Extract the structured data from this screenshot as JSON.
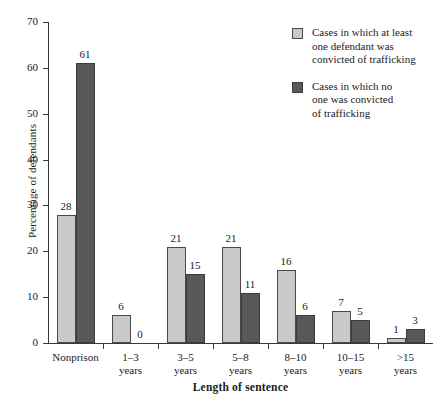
{
  "chart_data": {
    "type": "bar",
    "title": "",
    "xlabel": "Length of sentence",
    "ylabel": "Percentage of defendants",
    "ylim": [
      0,
      70
    ],
    "yticks": [
      0,
      10,
      20,
      30,
      40,
      50,
      60,
      70
    ],
    "grid": false,
    "legend_position": "top-right",
    "categories": [
      "Nonprison",
      "1–3\nyears",
      "3–5\nyears",
      "5–8\nyears",
      "8–10\nyears",
      "10–15\nyears",
      ">15\nyears"
    ],
    "series": [
      {
        "name": "Cases in which at least one defendant was convicted of trafficking",
        "color": "#c9c9c9",
        "values": [
          28,
          6,
          21,
          21,
          16,
          7,
          1
        ]
      },
      {
        "name": "Cases in which no one was convicted of trafficking",
        "color": "#585858",
        "values": [
          61,
          0,
          15,
          11,
          6,
          5,
          3
        ]
      }
    ]
  },
  "legend": {
    "entries": [
      {
        "label": "Cases in which at least\none defendant was\nconvicted of trafficking",
        "swatch": "light"
      },
      {
        "label": "Cases in which no\none was convicted\nof trafficking",
        "swatch": "dark"
      }
    ]
  },
  "axes": {
    "y_title": "Percentage of defendants",
    "x_title": "Length of sentence",
    "y_tick_labels": [
      "0",
      "10",
      "20",
      "30",
      "40",
      "50",
      "60",
      "70"
    ]
  }
}
